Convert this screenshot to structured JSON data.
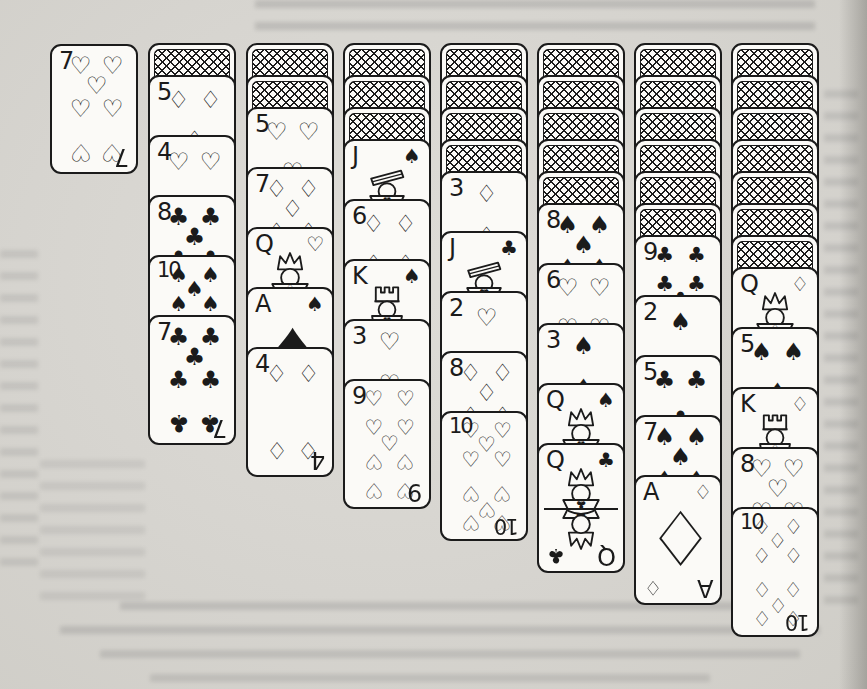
{
  "colors": {
    "paper": "#d7d5d0",
    "card": "#fbfaf7",
    "ink": "#1b1b1b"
  },
  "suit_glyphs": {
    "hearts": "♡",
    "diamonds": "♢",
    "spades": "♠",
    "clubs": "♣"
  },
  "card_back": {
    "pattern": "crosshatch"
  },
  "stock_card": {
    "rank": "7",
    "suit": "hearts"
  },
  "columns": [
    {
      "face_down": 1,
      "face_up": [
        {
          "rank": "5",
          "suit": "diamonds"
        },
        {
          "rank": "4",
          "suit": "hearts"
        },
        {
          "rank": "8",
          "suit": "clubs"
        },
        {
          "rank": "10",
          "suit": "spades"
        },
        {
          "rank": "7",
          "suit": "clubs"
        }
      ]
    },
    {
      "face_down": 2,
      "face_up": [
        {
          "rank": "5",
          "suit": "hearts"
        },
        {
          "rank": "7",
          "suit": "diamonds"
        },
        {
          "rank": "Q",
          "suit": "hearts"
        },
        {
          "rank": "A",
          "suit": "spades"
        },
        {
          "rank": "4",
          "suit": "diamonds"
        }
      ]
    },
    {
      "face_down": 3,
      "face_up": [
        {
          "rank": "J",
          "suit": "spades"
        },
        {
          "rank": "6",
          "suit": "diamonds"
        },
        {
          "rank": "K",
          "suit": "spades"
        },
        {
          "rank": "3",
          "suit": "hearts"
        },
        {
          "rank": "9",
          "suit": "hearts"
        }
      ]
    },
    {
      "face_down": 4,
      "face_up": [
        {
          "rank": "3",
          "suit": "diamonds"
        },
        {
          "rank": "J",
          "suit": "clubs"
        },
        {
          "rank": "2",
          "suit": "hearts"
        },
        {
          "rank": "8",
          "suit": "diamonds"
        },
        {
          "rank": "10",
          "suit": "hearts"
        }
      ]
    },
    {
      "face_down": 5,
      "face_up": [
        {
          "rank": "8",
          "suit": "spades"
        },
        {
          "rank": "6",
          "suit": "hearts"
        },
        {
          "rank": "3",
          "suit": "spades"
        },
        {
          "rank": "Q",
          "suit": "spades"
        },
        {
          "rank": "Q",
          "suit": "clubs"
        }
      ]
    },
    {
      "face_down": 6,
      "face_up": [
        {
          "rank": "9",
          "suit": "clubs"
        },
        {
          "rank": "2",
          "suit": "spades"
        },
        {
          "rank": "5",
          "suit": "clubs"
        },
        {
          "rank": "7",
          "suit": "spades"
        },
        {
          "rank": "A",
          "suit": "diamonds"
        }
      ]
    },
    {
      "face_down": 7,
      "face_up": [
        {
          "rank": "Q",
          "suit": "diamonds"
        },
        {
          "rank": "5",
          "suit": "spades"
        },
        {
          "rank": "K",
          "suit": "diamonds"
        },
        {
          "rank": "8",
          "suit": "hearts"
        },
        {
          "rank": "10",
          "suit": "diamonds"
        }
      ]
    }
  ]
}
